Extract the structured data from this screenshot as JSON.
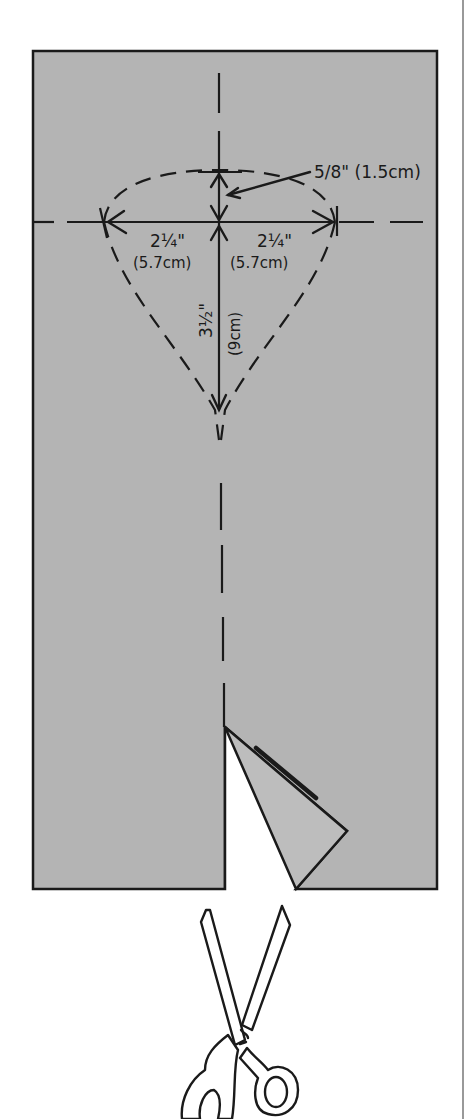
{
  "diagram": {
    "colors": {
      "paper": "#b4b4b4",
      "ink": "#1a1a1a",
      "background": "#ffffff"
    },
    "measurements": {
      "top_offset": "5/8\" (1.5cm)",
      "left_width_in": "2¼\"",
      "left_width_cm": "(5.7cm)",
      "right_width_in": "2¼\"",
      "right_width_cm": "(5.7cm)",
      "depth_in": "3½\"",
      "depth_cm": "(9cm)"
    },
    "elements": {
      "paper_sheet": "paper-rectangle",
      "cut_flap": "folded-triangle-flap",
      "tool": "scissors-icon"
    }
  }
}
